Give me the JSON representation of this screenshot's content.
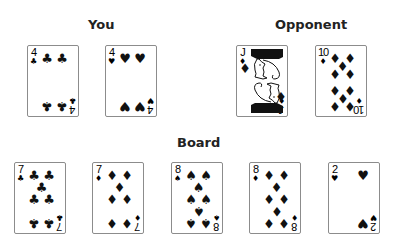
{
  "headings": {
    "you": "You",
    "opponent": "Opponent",
    "board": "Board"
  },
  "colors": {
    "card_border": "#8c8c8c",
    "suit_ink": "#111111",
    "heading": "#222222"
  },
  "you": {
    "cards": [
      {
        "rank": "4",
        "suit": "clubs",
        "symbol": "♣"
      },
      {
        "rank": "4",
        "suit": "hearts",
        "symbol": "♥"
      }
    ]
  },
  "opponent": {
    "cards": [
      {
        "rank": "J",
        "suit": "diamonds",
        "symbol": "♦"
      },
      {
        "rank": "10",
        "suit": "diamonds",
        "symbol": "♦"
      }
    ]
  },
  "board": {
    "cards": [
      {
        "rank": "7",
        "suit": "clubs",
        "symbol": "♣"
      },
      {
        "rank": "7",
        "suit": "diamonds",
        "symbol": "♦"
      },
      {
        "rank": "8",
        "suit": "spades",
        "symbol": "♠"
      },
      {
        "rank": "8",
        "suit": "diamonds",
        "symbol": "♦"
      },
      {
        "rank": "2",
        "suit": "hearts",
        "symbol": "♥"
      }
    ]
  }
}
